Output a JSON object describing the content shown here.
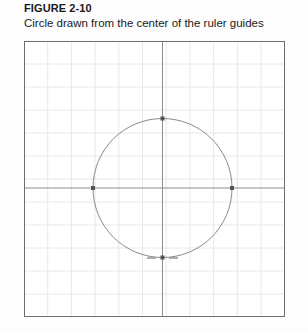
{
  "figure": {
    "title": "FIGURE 2-10",
    "subtitle": "Circle drawn from the center of the ruler guides"
  },
  "canvas": {
    "name": "illustration-artboard",
    "width": 261,
    "height": 276,
    "background_color": "#ffffff",
    "border_color": "#6e6e6e",
    "grid": {
      "visible": true,
      "line_color": "#e8e8e8",
      "column_spacing": 23.7,
      "row_spacing": 23.0,
      "columns": 11,
      "rows": 12
    },
    "ruler_guides": {
      "visible": true,
      "color": "#8d8d8d",
      "vertical_x": 138.5,
      "horizontal_y": 147.0
    },
    "shape": {
      "type": "circle",
      "stroke_color": "#8a8a8a",
      "stroke_width": 1,
      "fill": "none",
      "center_x": 138.5,
      "center_y": 147.0,
      "radius": 69.5
    },
    "anchor_points": [
      {
        "label": "top-anchor",
        "x": 138.5,
        "y": 77.5
      },
      {
        "label": "left-anchor",
        "x": 69.0,
        "y": 147.0
      },
      {
        "label": "right-anchor",
        "x": 208.0,
        "y": 147.0
      },
      {
        "label": "bottom-anchor",
        "x": 138.5,
        "y": 216.5
      }
    ],
    "anchor_color": "#555555",
    "bottom_handle_marks": {
      "visible": true,
      "color": "#9a9a9a",
      "y": 217.0,
      "segments": [
        {
          "x1": 123.0,
          "x2": 132.0
        },
        {
          "x1": 145.0,
          "x2": 154.0
        }
      ]
    }
  }
}
